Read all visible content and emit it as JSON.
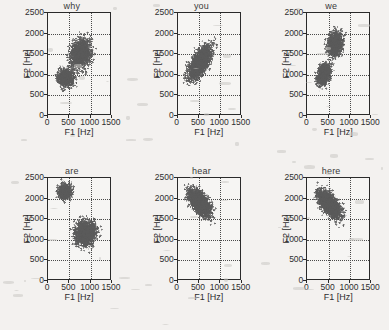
{
  "figure": {
    "background_color": "#f3f1ef",
    "marker_color": "#5a5a5a",
    "axis_color": "#2a2a2a",
    "grid_color": "#4a4a4a",
    "marker_symbol": "+"
  },
  "axes": {
    "xlabel": "F1 [Hz]",
    "ylabel": "F2 [Hz]",
    "xticks": [
      0,
      500,
      1000,
      1500
    ],
    "yticks": [
      0,
      500,
      1000,
      1500,
      2000,
      2500
    ],
    "xlim": [
      0,
      1500
    ],
    "ylim": [
      0,
      2500
    ],
    "grid": true,
    "gridstyle": "dotted",
    "xgrid_values": [
      500,
      1000
    ],
    "ygrid_values": [
      500,
      1000,
      1500,
      2000
    ]
  },
  "chart_data": {
    "type": "scatter",
    "title": "",
    "xlabel": "F1 [Hz]",
    "ylabel": "F2 [Hz]",
    "xlim": [
      0,
      1500
    ],
    "ylim": [
      0,
      2500
    ],
    "grid": true,
    "legend": "none",
    "marker": "+",
    "panels": [
      {
        "title": "why",
        "row": 0,
        "col": 0,
        "n_points": 2600,
        "clusters": [
          {
            "name": "upper-lobe",
            "cx": 770,
            "cy": 1520,
            "sx": 200,
            "sy": 300,
            "rot": -12,
            "weight": 0.62,
            "x_range": [
              300,
              1200
            ],
            "y_range": [
              900,
              2080
            ]
          },
          {
            "name": "lower-lobe",
            "cx": 420,
            "cy": 920,
            "sx": 170,
            "sy": 190,
            "rot": 10,
            "weight": 0.38,
            "x_range": [
              150,
              800
            ],
            "y_range": [
              540,
              1350
            ]
          }
        ],
        "x_extent": [
          150,
          1200
        ],
        "y_extent": [
          540,
          2080
        ]
      },
      {
        "title": "you",
        "row": 0,
        "col": 1,
        "n_points": 2400,
        "clusters": [
          {
            "name": "main-diagonal",
            "cx": 520,
            "cy": 1290,
            "sx": 155,
            "sy": 360,
            "rot": -28,
            "weight": 1.0,
            "x_range": [
              120,
              950
            ],
            "y_range": [
              580,
              2120
            ]
          }
        ],
        "x_extent": [
          120,
          950
        ],
        "y_extent": [
          580,
          2120
        ]
      },
      {
        "title": "we",
        "row": 0,
        "col": 2,
        "n_points": 2500,
        "clusters": [
          {
            "name": "upper-lobe",
            "cx": 660,
            "cy": 1750,
            "sx": 150,
            "sy": 235,
            "rot": -8,
            "weight": 0.55,
            "x_range": [
              400,
              960
            ],
            "y_range": [
              1300,
              2220
            ]
          },
          {
            "name": "lower-lobe",
            "cx": 390,
            "cy": 1000,
            "sx": 125,
            "sy": 225,
            "rot": -18,
            "weight": 0.45,
            "x_range": [
              180,
              640
            ],
            "y_range": [
              540,
              1500
            ]
          }
        ],
        "x_extent": [
          180,
          960
        ],
        "y_extent": [
          540,
          2220
        ]
      },
      {
        "title": "are",
        "row": 1,
        "col": 0,
        "n_points": 2700,
        "clusters": [
          {
            "name": "upper-cluster",
            "cx": 400,
            "cy": 2170,
            "sx": 125,
            "sy": 155,
            "rot": -15,
            "weight": 0.33,
            "x_range": [
              180,
              660
            ],
            "y_range": [
              1830,
              2480
            ]
          },
          {
            "name": "lower-cluster",
            "cx": 880,
            "cy": 1160,
            "sx": 215,
            "sy": 255,
            "rot": -20,
            "weight": 0.67,
            "x_range": [
              530,
              1290
            ],
            "y_range": [
              590,
              1740
            ]
          }
        ],
        "x_extent": [
          180,
          1290
        ],
        "y_extent": [
          590,
          2480
        ]
      },
      {
        "title": "hear",
        "row": 1,
        "col": 1,
        "n_points": 2400,
        "clusters": [
          {
            "name": "main-diagonal",
            "cx": 510,
            "cy": 1890,
            "sx": 150,
            "sy": 310,
            "rot": 34,
            "weight": 1.0,
            "x_range": [
              130,
              960
            ],
            "y_range": [
              1230,
              2480
            ]
          }
        ],
        "x_extent": [
          130,
          960
        ],
        "y_extent": [
          1230,
          2480
        ]
      },
      {
        "title": "here",
        "row": 1,
        "col": 2,
        "n_points": 2400,
        "clusters": [
          {
            "name": "main-diagonal",
            "cx": 520,
            "cy": 1870,
            "sx": 145,
            "sy": 320,
            "rot": 36,
            "weight": 1.0,
            "x_range": [
              150,
              1000
            ],
            "y_range": [
              1210,
              2470
            ]
          }
        ],
        "x_extent": [
          150,
          1000
        ],
        "y_extent": [
          1210,
          2470
        ]
      }
    ]
  }
}
